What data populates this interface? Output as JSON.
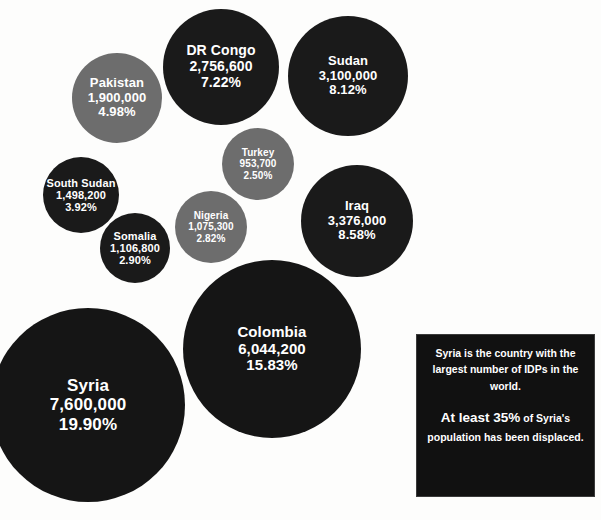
{
  "chart_data": {
    "type": "bubble",
    "title": "",
    "xlabel": "",
    "ylabel": "",
    "value_label": "IDPs",
    "categories": [
      "Syria",
      "Colombia",
      "Iraq",
      "Sudan",
      "DR Congo",
      "Pakistan",
      "South Sudan",
      "Somalia",
      "Nigeria",
      "Turkey"
    ],
    "values": [
      7600000,
      6044200,
      3376000,
      3100000,
      2756600,
      1900000,
      1498200,
      1106800,
      1075300,
      953700
    ],
    "percents": [
      19.9,
      15.83,
      8.58,
      8.12,
      7.22,
      4.98,
      3.92,
      2.9,
      2.82,
      2.5
    ],
    "bubbles": [
      {
        "name": "Syria",
        "value": "7,600,000",
        "percent": "19.90%",
        "color": "#151515",
        "cx": 88,
        "cy": 405,
        "r": 97,
        "name_size": 17,
        "value_size": 17,
        "pct_size": 17
      },
      {
        "name": "Colombia",
        "value": "6,044,200",
        "percent": "15.83%",
        "color": "#151515",
        "cx": 272,
        "cy": 349,
        "r": 89,
        "name_size": 15,
        "value_size": 15,
        "pct_size": 15
      },
      {
        "name": "Iraq",
        "value": "3,376,000",
        "percent": "8.58%",
        "color": "#1a1a1a",
        "cx": 357,
        "cy": 221,
        "r": 56,
        "name_size": 13,
        "value_size": 13,
        "pct_size": 13
      },
      {
        "name": "Sudan",
        "value": "3,100,000",
        "percent": "8.12%",
        "color": "#1a1a1a",
        "cx": 348,
        "cy": 76,
        "r": 60,
        "name_size": 13,
        "value_size": 13,
        "pct_size": 13
      },
      {
        "name": "DR Congo",
        "value": "2,756,600",
        "percent": "7.22%",
        "color": "#1a1a1a",
        "cx": 221,
        "cy": 67,
        "r": 58,
        "name_size": 14,
        "value_size": 14,
        "pct_size": 14
      },
      {
        "name": "Pakistan",
        "value": "1,900,000",
        "percent": "4.98%",
        "color": "#6d6d6d",
        "cx": 117,
        "cy": 98,
        "r": 45,
        "name_size": 13,
        "value_size": 13,
        "pct_size": 13
      },
      {
        "name": "South Sudan",
        "value": "1,498,200",
        "percent": "3.92%",
        "color": "#1a1a1a",
        "cx": 81,
        "cy": 195,
        "r": 38,
        "name_size": 11,
        "value_size": 11,
        "pct_size": 11
      },
      {
        "name": "Somalia",
        "value": "1,106,800",
        "percent": "2.90%",
        "color": "#1a1a1a",
        "cx": 135,
        "cy": 248,
        "r": 35,
        "name_size": 11,
        "value_size": 11,
        "pct_size": 11
      },
      {
        "name": "Nigeria",
        "value": "1,075,300",
        "percent": "2.82%",
        "color": "#6d6d6d",
        "cx": 211,
        "cy": 227,
        "r": 36,
        "name_size": 10,
        "value_size": 10,
        "pct_size": 10
      },
      {
        "name": "Turkey",
        "value": "953,700",
        "percent": "2.50%",
        "color": "#6d6d6d",
        "cx": 258,
        "cy": 164,
        "r": 36,
        "name_size": 10,
        "value_size": 10,
        "pct_size": 10
      }
    ],
    "background_color": "#fdfdfc",
    "text_color": "#ffffff"
  },
  "note": {
    "paragraph_1": "Syria is the country with the largest number of IDPs in the world.",
    "paragraph_2_strong": "At least 35%",
    "paragraph_2_rest": " of Syria's population has been displaced.",
    "background_color": "#111111",
    "border_color": "#3a3a3a"
  }
}
